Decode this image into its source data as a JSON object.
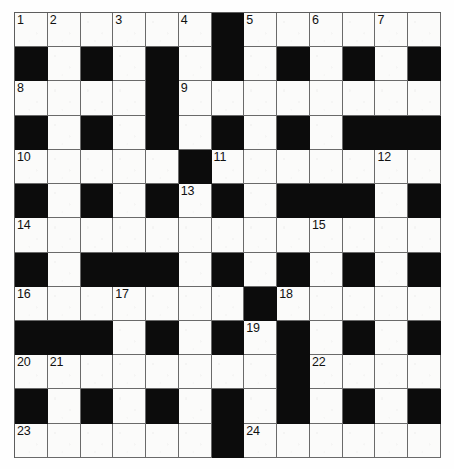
{
  "puzzle": {
    "type": "crossword-grid",
    "rows": 13,
    "cols": 13,
    "colors": {
      "block": "#0c0c0c",
      "cell": "#fbfbfa",
      "grid_line": "#6a6a6a",
      "number_text": "#111111",
      "page_background": "#ffffff"
    },
    "legend": {
      "white": "open letter cell",
      "black": "blocked cell"
    },
    "grid": [
      [
        "W",
        "W",
        "W",
        "W",
        "W",
        "W",
        "B",
        "W",
        "W",
        "W",
        "W",
        "W",
        "W"
      ],
      [
        "B",
        "W",
        "B",
        "W",
        "B",
        "W",
        "B",
        "W",
        "B",
        "W",
        "B",
        "W",
        "B"
      ],
      [
        "W",
        "W",
        "W",
        "W",
        "B",
        "W",
        "W",
        "W",
        "W",
        "W",
        "W",
        "W",
        "W"
      ],
      [
        "B",
        "W",
        "B",
        "W",
        "B",
        "W",
        "B",
        "W",
        "B",
        "W",
        "B",
        "B",
        "B"
      ],
      [
        "W",
        "W",
        "W",
        "W",
        "W",
        "B",
        "W",
        "W",
        "W",
        "W",
        "W",
        "W",
        "W"
      ],
      [
        "B",
        "W",
        "B",
        "W",
        "B",
        "W",
        "B",
        "W",
        "B",
        "B",
        "B",
        "W",
        "B"
      ],
      [
        "W",
        "W",
        "W",
        "W",
        "W",
        "W",
        "W",
        "W",
        "W",
        "W",
        "W",
        "W",
        "W"
      ],
      [
        "B",
        "W",
        "B",
        "B",
        "B",
        "W",
        "B",
        "W",
        "B",
        "W",
        "B",
        "W",
        "B"
      ],
      [
        "W",
        "W",
        "W",
        "W",
        "W",
        "W",
        "W",
        "B",
        "W",
        "W",
        "W",
        "W",
        "W"
      ],
      [
        "B",
        "B",
        "B",
        "W",
        "B",
        "W",
        "B",
        "W",
        "B",
        "W",
        "B",
        "W",
        "B"
      ],
      [
        "W",
        "W",
        "W",
        "W",
        "W",
        "W",
        "W",
        "W",
        "B",
        "W",
        "W",
        "W",
        "W"
      ],
      [
        "B",
        "W",
        "B",
        "W",
        "B",
        "W",
        "B",
        "W",
        "B",
        "W",
        "B",
        "W",
        "B"
      ],
      [
        "W",
        "W",
        "W",
        "W",
        "W",
        "W",
        "B",
        "W",
        "W",
        "W",
        "W",
        "W",
        "W"
      ]
    ],
    "numbers": [
      {
        "row": 0,
        "col": 0,
        "n": "1"
      },
      {
        "row": 0,
        "col": 1,
        "n": "2"
      },
      {
        "row": 0,
        "col": 3,
        "n": "3"
      },
      {
        "row": 0,
        "col": 5,
        "n": "4"
      },
      {
        "row": 0,
        "col": 7,
        "n": "5"
      },
      {
        "row": 0,
        "col": 9,
        "n": "6"
      },
      {
        "row": 0,
        "col": 11,
        "n": "7"
      },
      {
        "row": 2,
        "col": 0,
        "n": "8"
      },
      {
        "row": 2,
        "col": 5,
        "n": "9"
      },
      {
        "row": 4,
        "col": 0,
        "n": "10"
      },
      {
        "row": 4,
        "col": 6,
        "n": "11"
      },
      {
        "row": 4,
        "col": 11,
        "n": "12"
      },
      {
        "row": 5,
        "col": 5,
        "n": "13"
      },
      {
        "row": 6,
        "col": 0,
        "n": "14"
      },
      {
        "row": 6,
        "col": 9,
        "n": "15"
      },
      {
        "row": 8,
        "col": 0,
        "n": "16"
      },
      {
        "row": 8,
        "col": 3,
        "n": "17"
      },
      {
        "row": 8,
        "col": 8,
        "n": "18"
      },
      {
        "row": 9,
        "col": 7,
        "n": "19"
      },
      {
        "row": 10,
        "col": 0,
        "n": "20"
      },
      {
        "row": 10,
        "col": 1,
        "n": "21"
      },
      {
        "row": 10,
        "col": 9,
        "n": "22"
      },
      {
        "row": 12,
        "col": 0,
        "n": "23"
      },
      {
        "row": 12,
        "col": 7,
        "n": "24"
      }
    ],
    "letters": []
  }
}
